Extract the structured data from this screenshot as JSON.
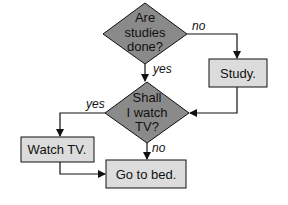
{
  "diagram": {
    "type": "flowchart",
    "colors": {
      "decision_fill": "#8a8a8a",
      "process_fill": "#dcdcdc",
      "stroke": "#111111",
      "background": "#ffffff"
    },
    "nodes": {
      "q1": {
        "kind": "decision",
        "lines": [
          "Are",
          "studies",
          "done?"
        ]
      },
      "study": {
        "kind": "process",
        "label": "Study."
      },
      "q2": {
        "kind": "decision",
        "lines": [
          "Shall",
          "I watch",
          "TV?"
        ]
      },
      "watch": {
        "kind": "process",
        "label": "Watch TV."
      },
      "bed": {
        "kind": "process",
        "label": "Go to bed."
      }
    },
    "edges": {
      "q1_no": {
        "from": "q1",
        "to": "study",
        "label": "no"
      },
      "q1_yes": {
        "from": "q1",
        "to": "q2",
        "label": "yes"
      },
      "study_q2": {
        "from": "study",
        "to": "q2",
        "label": ""
      },
      "q2_yes": {
        "from": "q2",
        "to": "watch",
        "label": "yes"
      },
      "q2_no": {
        "from": "q2",
        "to": "bed",
        "label": "no"
      },
      "watch_bed": {
        "from": "watch",
        "to": "bed",
        "label": ""
      }
    }
  }
}
